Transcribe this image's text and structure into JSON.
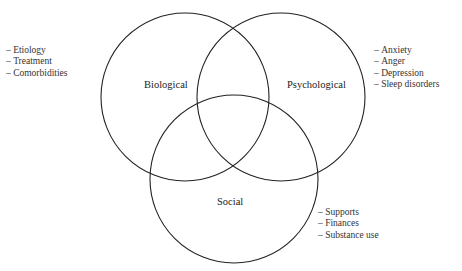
{
  "diagram": {
    "type": "venn",
    "line_color": "#222222",
    "circles": [
      {
        "id": "biological",
        "label": "Biological",
        "items": [
          "Etiology",
          "Treatment",
          "Comorbidities"
        ]
      },
      {
        "id": "psychological",
        "label": "Psychological",
        "items": [
          "Anxiety",
          "Anger",
          "Depression",
          "Sleep disorders"
        ]
      },
      {
        "id": "social",
        "label": "Social",
        "items": [
          "Supports",
          "Finances",
          "Substance use"
        ]
      }
    ]
  }
}
